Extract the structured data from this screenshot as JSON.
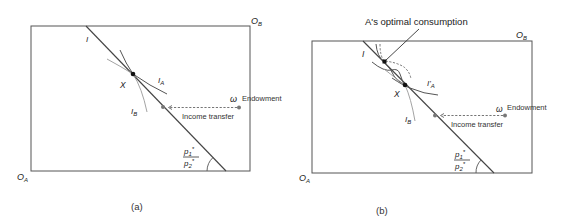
{
  "panels": [
    {
      "id": "a",
      "caption": "(a)",
      "origin_a": {
        "main": "O",
        "sub": "A"
      },
      "origin_b": {
        "main": "O",
        "sub": "B"
      },
      "budget_line_label": "I",
      "equilibrium_label": "X",
      "indifference_a": {
        "main": "I",
        "sub": "A"
      },
      "indifference_b": {
        "main": "I",
        "sub": "B"
      },
      "endowment_symbol": "ω",
      "endowment_label": "Endowment",
      "transfer_label": "Income transfer",
      "price_ratio": {
        "num": "p",
        "num_sub": "1",
        "num_sup": "*",
        "den": "p",
        "den_sub": "2",
        "den_sup": "*"
      }
    },
    {
      "id": "b",
      "caption": "(b)",
      "origin_a": {
        "main": "O",
        "sub": "A"
      },
      "origin_b": {
        "main": "O",
        "sub": "B"
      },
      "budget_line_label": "I",
      "equilibrium_label": "X",
      "indifference_a": {
        "main": "I'",
        "sub": "A"
      },
      "indifference_b": {
        "main": "I",
        "sub": "B"
      },
      "endowment_symbol": "ω",
      "endowment_label": "Endowment",
      "transfer_label": "Income transfer",
      "annotation": "A's optimal consumption",
      "price_ratio": {
        "num": "p",
        "num_sub": "1",
        "num_sup": "*",
        "den": "p",
        "den_sub": "2",
        "den_sup": "*"
      }
    }
  ],
  "colors": {
    "line": "#444444",
    "point": "#111111",
    "transfer_point": "#777777"
  }
}
